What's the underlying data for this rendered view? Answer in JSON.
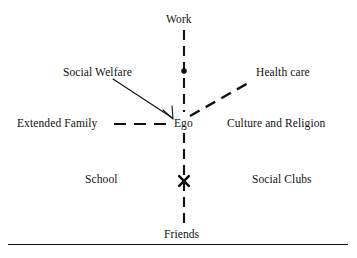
{
  "diagram": {
    "type": "ecomap",
    "title": "",
    "center_node": "Ego",
    "background_color": "#ffffff",
    "line_color": "#111111",
    "nodes": [
      {
        "id": "work",
        "label": "Work",
        "position": "top",
        "connector": "dashed-vertical"
      },
      {
        "id": "social-welfare",
        "label": "Social Welfare",
        "position": "upper-left",
        "connector": "solid-arrow"
      },
      {
        "id": "health-care",
        "label": "Health care",
        "position": "upper-right",
        "connector": "dashed-diagonal"
      },
      {
        "id": "extended-family",
        "label": "Extended Family",
        "position": "left",
        "connector": "dashed-horizontal"
      },
      {
        "id": "ego",
        "label": "Ego",
        "position": "center",
        "connector": "none"
      },
      {
        "id": "culture",
        "label": "Culture and Religion",
        "position": "right",
        "connector": "none"
      },
      {
        "id": "school",
        "label": "School",
        "position": "lower-left",
        "connector": "none"
      },
      {
        "id": "social-clubs",
        "label": "Social Clubs",
        "position": "lower-right",
        "connector": "none"
      },
      {
        "id": "friends",
        "label": "Friends",
        "position": "bottom",
        "connector": "dashed-vertical"
      }
    ],
    "markers": [
      {
        "id": "dot-marker",
        "glyph": "dot",
        "on": "vertical-axis-upper",
        "x": 184,
        "y": 71
      },
      {
        "id": "cross-marker",
        "glyph": "cross",
        "on": "vertical-axis-lower",
        "x": 184,
        "y": 181
      }
    ],
    "edges": [
      {
        "from": "work",
        "to": "ego",
        "style": "dashed"
      },
      {
        "from": "friends",
        "to": "ego",
        "style": "dashed"
      },
      {
        "from": "extended-family",
        "to": "ego",
        "style": "dashed"
      },
      {
        "from": "health-care",
        "to": "ego",
        "style": "dashed"
      },
      {
        "from": "social-welfare",
        "to": "ego",
        "style": "solid-arrow"
      }
    ],
    "baseline_rule": true
  }
}
